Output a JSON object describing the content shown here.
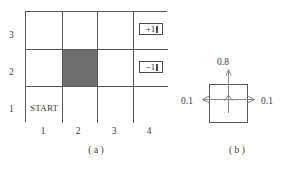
{
  "figure": {
    "type": "gridworld-mdp-diagram",
    "panels": [
      {
        "id": "a",
        "caption": "( a )"
      },
      {
        "id": "b",
        "caption": "( b )"
      }
    ]
  },
  "gridworld": {
    "columns": 4,
    "rows": 3,
    "row_labels": [
      "3",
      "2",
      "1"
    ],
    "column_labels": [
      "1",
      "2",
      "3",
      "4"
    ],
    "start_label": "START",
    "start_cell": {
      "column": 1,
      "row": 1
    },
    "blocked_cell": {
      "column": 2,
      "row": 2
    },
    "blocked_color": "#6e6e6e",
    "grid_line_color": "#58585a",
    "terminals": [
      {
        "label": "+1",
        "column": 4,
        "row": 3
      },
      {
        "label": "−1",
        "column": 4,
        "row": 2
      }
    ]
  },
  "transition_model": {
    "forward_probability": "0.8",
    "left_probability": "0.1",
    "right_probability": "0.1",
    "square_border_color": "#58585a",
    "arrow_color": "#7a7a7c"
  }
}
